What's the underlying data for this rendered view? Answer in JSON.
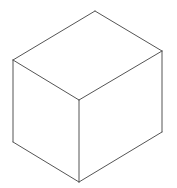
{
  "diagram": {
    "type": "isometric-cube",
    "stroke_color": "#555555",
    "background": "#ffffff",
    "vertices": {
      "top": [
        95,
        11
      ],
      "left_top": [
        13,
        60
      ],
      "right_top": [
        162,
        51
      ],
      "front_center": [
        79,
        100
      ],
      "left_bottom": [
        13,
        142
      ],
      "right_bottom": [
        162,
        132
      ],
      "bottom": [
        79,
        182
      ]
    },
    "faces": [
      "top",
      "left",
      "right"
    ]
  }
}
